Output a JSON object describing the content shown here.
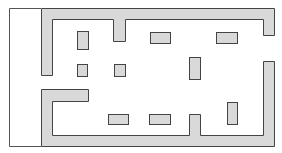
{
  "diagram": {
    "type": "floor-plan",
    "colors": {
      "background": "#ffffff",
      "fill": "#d9d9d9",
      "stroke": "#444444",
      "frame": "#555555"
    },
    "frame_lines": [
      {
        "name": "frame-left-line",
        "points": "9.5,146.5 9.5,8.5 41,8.5"
      },
      {
        "name": "frame-bottom-line",
        "points": "9.5,146.5 41,146.5"
      }
    ],
    "walls": [
      {
        "name": "upper-wall",
        "points": "41.5,75.5 41.5,8.5 274.5,8.5 274.5,35.5 263.5,35.5 263.5,19.5 125.5,19.5 125.5,41.5 113.5,41.5 113.5,19.5 52.5,19.5 52.5,75.5"
      },
      {
        "name": "lower-wall",
        "points": "41.5,146.5 41.5,89.5 88.5,89.5 88.5,101.5 52.5,101.5 52.5,135.5 189.5,135.5 189.5,114.5 200.5,114.5 200.5,135.5 263.5,135.5 263.5,61.5 274.5,61.5 274.5,146.5"
      }
    ],
    "blocks": [
      {
        "name": "block-1",
        "x": 77.5,
        "y": 31.5,
        "w": 11,
        "h": 18
      },
      {
        "name": "block-2",
        "x": 150.5,
        "y": 32.5,
        "w": 20,
        "h": 11
      },
      {
        "name": "block-3",
        "x": 216.5,
        "y": 32.5,
        "w": 21,
        "h": 11
      },
      {
        "name": "block-4",
        "x": 77.5,
        "y": 64.5,
        "w": 10,
        "h": 12
      },
      {
        "name": "block-5",
        "x": 114.5,
        "y": 64.5,
        "w": 11,
        "h": 12
      },
      {
        "name": "block-6",
        "x": 189.5,
        "y": 57.5,
        "w": 11,
        "h": 22
      },
      {
        "name": "block-7",
        "x": 108.5,
        "y": 114.5,
        "w": 20,
        "h": 10
      },
      {
        "name": "block-8",
        "x": 149.5,
        "y": 114.5,
        "w": 21,
        "h": 10
      },
      {
        "name": "block-9",
        "x": 227.5,
        "y": 102.5,
        "w": 10,
        "h": 22
      }
    ]
  }
}
